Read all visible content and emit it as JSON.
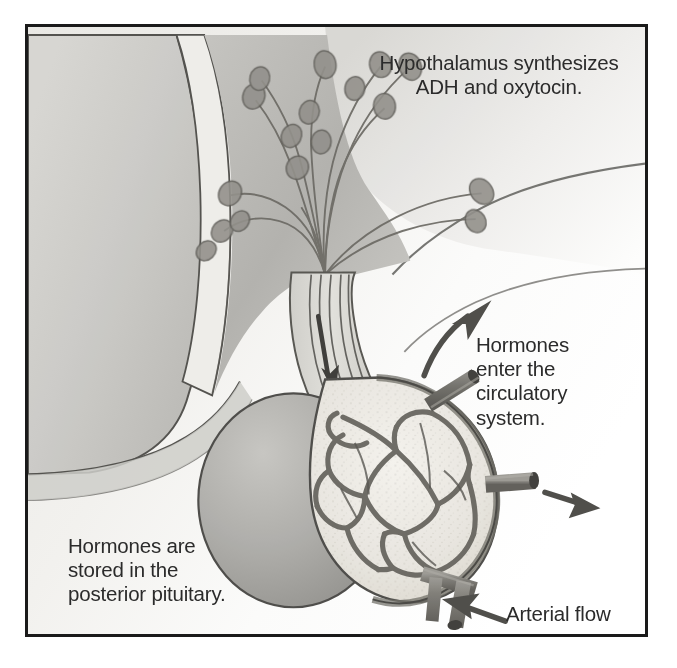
{
  "figure": {
    "border_color": "#1a1a1a",
    "background_color": "#ffffff",
    "text_color": "#2b2b2b"
  },
  "labels": {
    "hypothalamus": "Hypothalamus synthesizes\nADH  and oxytocin.",
    "circulatory": "Hormones\nenter the\ncirculatory\nsystem.",
    "storage": "Hormones are\nstored in  the\nposterior pituitary.",
    "arterial": "Arterial flow"
  },
  "structures": [
    {
      "name": "cerebral-tissue",
      "label": "brain tissue (coronal section)",
      "tone": "#c9c9c9"
    },
    {
      "name": "hypothalamus-region",
      "label": "hypothalamus",
      "tone": "#b4b4b4"
    },
    {
      "name": "neurosecretory-cells",
      "label": "neurosecretory cell bodies",
      "count": 14,
      "tone": "#8e8e8e"
    },
    {
      "name": "infundibulum",
      "label": "infundibulum (pituitary stalk)",
      "tone": "#d2d2d2"
    },
    {
      "name": "anterior-pituitary",
      "label": "anterior pituitary lobe",
      "tone": "#a8a8a8"
    },
    {
      "name": "posterior-pituitary",
      "label": "posterior pituitary lobe",
      "tone": "#e4e2dd"
    },
    {
      "name": "capillary-plexus",
      "label": "capillary bed",
      "tone": "#6f6f6f"
    },
    {
      "name": "blood-vessels",
      "label": "blood vessels",
      "count": 3,
      "tone": "#7a7a7a"
    }
  ],
  "arrows": [
    {
      "name": "axon-transport-arrow",
      "direction": "down",
      "meaning": "hormone transport down axons"
    },
    {
      "name": "hormone-exit-arrow-upper",
      "direction": "up-right",
      "meaning": "hormones enter circulation"
    },
    {
      "name": "hormone-exit-arrow-middle",
      "direction": "right",
      "meaning": "hormones enter circulation"
    },
    {
      "name": "arterial-inflow-arrow",
      "direction": "up-left",
      "meaning": "arterial blood flow in"
    }
  ]
}
